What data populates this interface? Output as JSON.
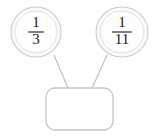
{
  "diagram": {
    "type": "fraction-tree",
    "title": "",
    "background_color": "#ffffff",
    "node_fill_color": "#fdfdfd",
    "node_stroke_color": "#c9c9c9",
    "connector_color": "#bcbcbc",
    "box_stroke_color": "#c4c4c4",
    "text_color": "#1a1a1a",
    "nodes": [
      {
        "id": "left-fraction",
        "shape": "circle",
        "numerator": "1",
        "denominator": "3",
        "value": "1/3",
        "cx": 36,
        "cy": 32,
        "rx": 25,
        "ry": 25
      },
      {
        "id": "right-fraction",
        "shape": "circle",
        "numerator": "1",
        "denominator": "11",
        "value": "1/11",
        "cx": 122,
        "cy": 32,
        "rx": 26,
        "ry": 25
      }
    ],
    "answer_box": {
      "id": "answer-box",
      "shape": "rounded-rectangle",
      "value": "",
      "placeholder": "",
      "x": 46,
      "y": 88,
      "width": 67,
      "height": 42,
      "corner_radius": 9
    },
    "connectors": [
      {
        "id": "connector-left",
        "from": "left-fraction",
        "to": "answer-box",
        "x1": 54,
        "y1": 55,
        "x2": 68,
        "y2": 88
      },
      {
        "id": "connector-right",
        "from": "right-fraction",
        "to": "answer-box",
        "x1": 107,
        "y1": 55,
        "x2": 92,
        "y2": 88
      }
    ]
  }
}
